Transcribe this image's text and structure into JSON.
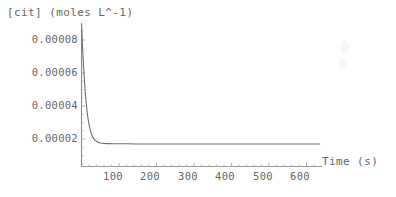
{
  "chart_data": {
    "type": "line",
    "title": "",
    "ylabel": "[cit] (moles L^-1)",
    "xlabel": "Time (s)",
    "xtick_labels": [
      "100",
      "200",
      "300",
      "400",
      "500",
      "600"
    ],
    "xticks": [
      100,
      200,
      300,
      400,
      500,
      600
    ],
    "ytick_labels": [
      "0.00002",
      "0.00004",
      "0.00006",
      "0.00008"
    ],
    "yticks": [
      2e-05,
      4e-05,
      6e-05,
      8e-05
    ],
    "xlim": [
      0,
      640
    ],
    "ylim": [
      0,
      9e-05
    ],
    "grid": false,
    "legend": null,
    "axis_color": "#7a7a7a",
    "line_color": "#6b6b6b",
    "background": "#ffffff",
    "series": [
      {
        "name": "[cit]",
        "x": [
          0,
          2,
          4,
          6,
          8,
          10,
          13,
          16,
          20,
          25,
          30,
          36,
          43,
          50,
          60,
          70,
          85,
          100,
          120,
          150,
          200,
          250,
          300,
          350,
          400,
          450,
          500,
          550,
          600,
          635
        ],
        "y": [
          9e-05,
          7.95e-05,
          7e-05,
          6.18e-05,
          5.46e-05,
          4.84e-05,
          4.06e-05,
          3.45e-05,
          2.87e-05,
          2.4e-05,
          2.11e-05,
          1.92e-05,
          1.81e-05,
          1.76e-05,
          1.73e-05,
          1.72e-05,
          1.71e-05,
          1.71e-05,
          1.71e-05,
          1.7e-05,
          1.7e-05,
          1.7e-05,
          1.7e-05,
          1.7e-05,
          1.7e-05,
          1.7e-05,
          1.7e-05,
          1.7e-05,
          1.7e-05,
          1.7e-05
        ]
      }
    ]
  },
  "axes": {
    "y_title": "[cit] (moles L^-1)",
    "x_title": "Time (s)",
    "ytick_0": "0.00008",
    "ytick_1": "0.00006",
    "ytick_2": "0.00004",
    "ytick_3": "0.00002",
    "xtick_0": "100",
    "xtick_1": "200",
    "xtick_2": "300",
    "xtick_3": "400",
    "xtick_4": "500",
    "xtick_5": "600"
  }
}
